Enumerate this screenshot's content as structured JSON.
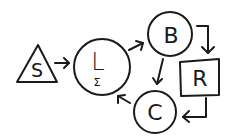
{
  "diagram": {
    "type": "hand-drawn flow diagram",
    "background": "#ffffff",
    "ink": "#1a1a1a",
    "nodes": [
      {
        "id": "S",
        "label": "S",
        "shape": "triangle",
        "sub_label": ""
      },
      {
        "id": "L",
        "label": "L",
        "shape": "circle",
        "sub_label": "Σ"
      },
      {
        "id": "B",
        "label": "B",
        "shape": "circle",
        "sub_label": ""
      },
      {
        "id": "R",
        "label": "R",
        "shape": "square",
        "sub_label": ""
      },
      {
        "id": "C",
        "label": "C",
        "shape": "circle",
        "sub_label": ""
      }
    ],
    "edges": [
      {
        "from": "S",
        "to": "L",
        "style": "straight"
      },
      {
        "from": "L",
        "to": "B",
        "style": "straight"
      },
      {
        "from": "B",
        "to": "R",
        "style": "elbow"
      },
      {
        "from": "B",
        "to": "C",
        "style": "straight"
      },
      {
        "from": "R",
        "to": "C",
        "style": "elbow"
      },
      {
        "from": "C",
        "to": "L",
        "style": "straight"
      }
    ]
  }
}
